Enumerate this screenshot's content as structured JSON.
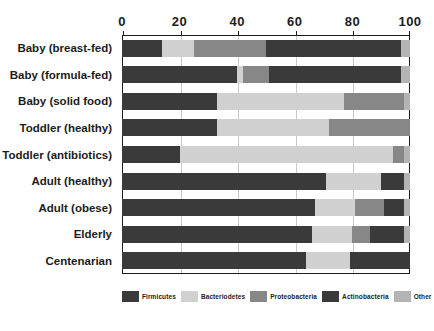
{
  "chart_data": {
    "type": "bar",
    "orientation": "horizontal",
    "stacked": true,
    "title": "",
    "xlabel": "",
    "ylabel": "",
    "xlim": [
      0,
      100
    ],
    "grid": true,
    "legend_position": "bottom",
    "xticks": [
      0,
      20,
      40,
      60,
      80,
      100
    ],
    "xtick_labels": [
      "0",
      "20",
      "40",
      "60",
      "80",
      "100"
    ],
    "categories": [
      "Baby (breast-fed)",
      "Baby (formula-fed)",
      "Baby (solid food)",
      "Toddler (healthy)",
      "Toddler (antibiotics)",
      "Adult (healthy)",
      "Adult (obese)",
      "Elderly",
      "Centenarian"
    ],
    "series": [
      {
        "name": "Firmicutes",
        "color": "#3a3a3a",
        "values": [
          14,
          40,
          33,
          33,
          20,
          71,
          67,
          66,
          64
        ]
      },
      {
        "name": "Bacteriodetes",
        "color": "#d0d0d0",
        "values": [
          11,
          2,
          44,
          39,
          74,
          19,
          14,
          14,
          15
        ]
      },
      {
        "name": "Proteobacteria",
        "color": "#878787",
        "values": [
          25,
          9,
          21,
          28,
          4,
          0,
          10,
          6,
          0
        ]
      },
      {
        "name": "Actinobacteria",
        "color": "#3a3a3a",
        "values": [
          47,
          46,
          0,
          0,
          0,
          8,
          7,
          12,
          21
        ]
      },
      {
        "name": "Other",
        "color": "#b4b4b4",
        "values": [
          3,
          3,
          2,
          0,
          2,
          2,
          2,
          2,
          0
        ]
      }
    ]
  },
  "legend": {
    "items": [
      {
        "label": "Firmicutes",
        "color": "#3a3a3a"
      },
      {
        "label": "Bacteriodetes",
        "color": "#d0d0d0"
      },
      {
        "label": "Proteobacteria",
        "color": "#878787"
      },
      {
        "label": "Actinobacteria",
        "color": "#3a3a3a"
      },
      {
        "label": "Other",
        "color": "#b4b4b4"
      }
    ]
  }
}
